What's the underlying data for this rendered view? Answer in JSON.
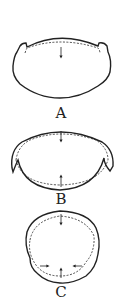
{
  "figures": [
    {
      "id": "A",
      "label": "A"
    },
    {
      "id": "B",
      "label": "B"
    },
    {
      "id": "C",
      "label": "C"
    }
  ],
  "colors": {
    "stroke": "#222222",
    "background": "#ffffff"
  }
}
